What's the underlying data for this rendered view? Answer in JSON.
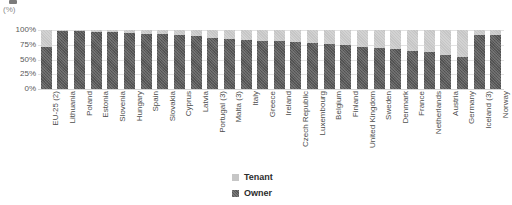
{
  "chart_data": {
    "type": "bar",
    "subtype": "stacked-percent-column",
    "title": "",
    "unit_label": "(%)",
    "xlabel": "",
    "ylabel": "",
    "ylim": [
      0,
      100
    ],
    "ytick_labels": [
      "100%",
      "75%",
      "50%",
      "25%",
      "0%"
    ],
    "ytick_values": [
      100,
      75,
      50,
      25,
      0
    ],
    "grid": true,
    "grid_axis": "y",
    "legend_position": "bottom-center",
    "legend": [
      "Tenant",
      "Owner"
    ],
    "colors": {
      "tenant": "#c6c6c6",
      "owner": "#5a5a5a",
      "grid": "#e2e2e2",
      "text": "#4d4d4d",
      "background": "#ffffff"
    },
    "categories": [
      "EU-25 (2)",
      "Lithuania",
      "Poland",
      "Estonia",
      "Slovenia",
      "Hungary",
      "Spain",
      "Slovakia",
      "Cyprus",
      "Latvia",
      "Portugal (3)",
      "Malta (3)",
      "Italy",
      "Greece",
      "Ireland",
      "Czech Republic",
      "Luxembourg",
      "Belgium",
      "Finland",
      "United Kingdom",
      "Sweden",
      "Denmark",
      "France",
      "Netherlands",
      "Austria",
      "Germany",
      "Iceland (3)",
      "Norway"
    ],
    "series": [
      {
        "name": "Owner",
        "values": [
          71,
          99,
          98,
          97,
          96,
          95,
          94,
          93,
          91,
          89,
          86,
          85,
          83,
          82,
          81,
          80,
          78,
          76,
          74,
          72,
          69,
          67,
          65,
          63,
          57,
          55,
          92,
          91
        ]
      },
      {
        "name": "Tenant",
        "values": [
          29,
          1,
          2,
          3,
          4,
          5,
          6,
          7,
          9,
          11,
          14,
          15,
          17,
          18,
          19,
          20,
          22,
          24,
          26,
          28,
          31,
          33,
          35,
          37,
          43,
          45,
          8,
          9
        ]
      }
    ]
  },
  "legend": {
    "tenant_label": "Tenant",
    "owner_label": "Owner"
  },
  "axis": {
    "unit": "(%)"
  }
}
